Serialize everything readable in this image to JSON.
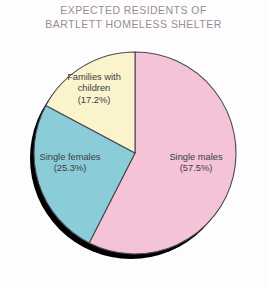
{
  "chart_data": {
    "type": "pie",
    "title": "EXPECTED RESIDENTS OF BARTLETT HOMELESS SHELTER",
    "title_lines": [
      "EXPECTED RESIDENTS OF",
      "BARTLETT HOMELESS SHELTER"
    ],
    "xlabel": "",
    "ylabel": "",
    "grid": false,
    "legend": "none (labels drawn inside slices)",
    "start_angle_deg": 0,
    "direction": "clockwise",
    "categories": [
      "Single males",
      "Single females",
      "Families with children"
    ],
    "values": [
      57.5,
      25.3,
      17.2
    ],
    "value_unit": "percent",
    "total": 100.0,
    "colors": [
      "#f5c3d7",
      "#8acdd8",
      "#faf3cc"
    ],
    "slice_outline_color": "#4a4a52",
    "shadow_color": "#000000",
    "background_color": "#fdfdfd",
    "title_color": "#9c8a99",
    "label_color": "#3b3b45",
    "slices": [
      {
        "name": "Single males",
        "value": 57.5,
        "percent_label": "(57.5%)",
        "label_lines": [
          "Single males",
          "(57.5%)"
        ],
        "color": "#f5c3d7"
      },
      {
        "name": "Single females",
        "value": 25.3,
        "percent_label": "(25.3%)",
        "label_lines": [
          "Single females",
          "(25.3%)"
        ],
        "color": "#8acdd8"
      },
      {
        "name": "Families with children",
        "value": 17.2,
        "percent_label": "(17.2%)",
        "label_lines": [
          "Families with",
          "children",
          "(17.2%)"
        ],
        "color": "#faf3cc"
      }
    ]
  }
}
